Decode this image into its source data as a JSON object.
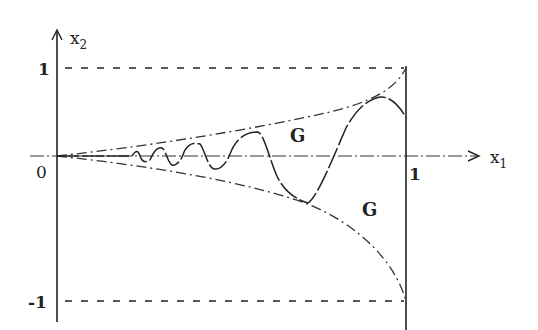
{
  "figure": {
    "axes": {
      "x_label": "x",
      "x_label_sub": "1",
      "y_label": "x",
      "y_label_sub": "2",
      "origin_label": "0",
      "x_tick_label": "1",
      "y_tick_top_label": "1",
      "y_tick_bottom_label": "-1"
    },
    "regions": [
      {
        "label": "G",
        "position": "upper"
      },
      {
        "label": "G",
        "position": "lower"
      }
    ],
    "colors": {
      "ink": "#222222",
      "background": "#ffffff"
    }
  }
}
